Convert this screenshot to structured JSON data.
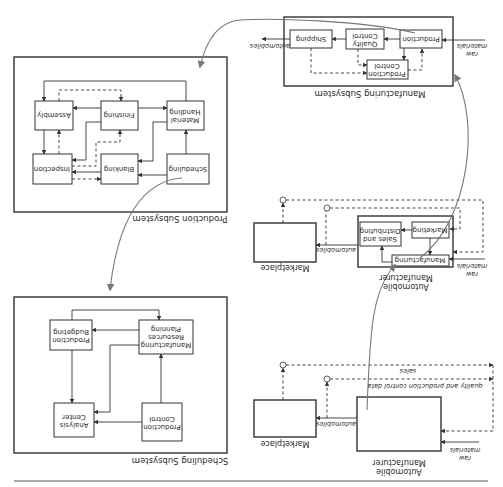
{
  "manufacturing_subsystem": {
    "title": "Manufacturing Subsystem",
    "nodes": {
      "production": "Production",
      "quality_control_1": "Quality",
      "quality_control_2": "Control",
      "shipping": "Shipping",
      "production_control_1": "Production",
      "production_control_2": "Control"
    },
    "input_label_1": "raw",
    "input_label_2": "materials",
    "output_label": "automobiles"
  },
  "production_subsystem": {
    "title": "Production Subsystem",
    "nodes": {
      "material_handling_1": "Material",
      "material_handling_2": "Handling",
      "finishing": "Finishing",
      "assembly": "Assembly",
      "scheduling": "Scheduling",
      "blanking": "Blanking",
      "inspection": "Inspection"
    }
  },
  "scheduling_subsystem": {
    "title": "Scheduling Subsystem",
    "nodes": {
      "mrp_1": "Manufacturing",
      "mrp_2": "Resources",
      "mrp_3": "Planning",
      "production_budgeting_1": "Production",
      "production_budgeting_2": "Budgeting",
      "production_control_1": "Production",
      "production_control_2": "Control",
      "analysis_center_1": "Analysis",
      "analysis_center_2": "Center"
    }
  },
  "middle_model": {
    "manufacturer_label_1": "Automobile",
    "manufacturer_label_2": "Manufacturer",
    "marketplace_label": "Marketplace",
    "nodes": {
      "marketing": "Marketing",
      "sales_distributing_1": "Sales and",
      "sales_distributing_2": "Distributing",
      "manufacturing": "Manufacturing"
    },
    "input_label_1": "raw",
    "input_label_2": "materials",
    "output_label": "automobiles"
  },
  "top_level_model": {
    "manufacturer_label_1": "Automobile",
    "manufacturer_label_2": "Manufacturer",
    "marketplace_label": "Marketplace",
    "input_label_1": "raw",
    "input_label_2": "materials",
    "output_label": "automobiles",
    "feedback_sales": "sales",
    "feedback_quality": "quality and production control data"
  }
}
